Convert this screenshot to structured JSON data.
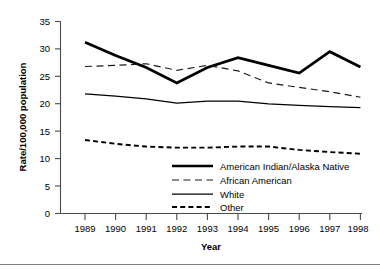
{
  "chart_data": {
    "type": "line",
    "title": "",
    "xlabel": "Year",
    "ylabel": "Rate/100,000 population",
    "x": [
      1989,
      1990,
      1991,
      1992,
      1993,
      1994,
      1995,
      1996,
      1997,
      1998
    ],
    "xticklabels": [
      "1989",
      "1990",
      "1991",
      "1992",
      "1993",
      "1994",
      "1995",
      "1996",
      "1997",
      "1998"
    ],
    "yticklabels": [
      "0",
      "5",
      "10",
      "15",
      "20",
      "25",
      "30",
      "35"
    ],
    "yticks": [
      0,
      5,
      10,
      15,
      20,
      25,
      30,
      35
    ],
    "ylim": [
      0,
      35
    ],
    "xlim": [
      1989,
      1998
    ],
    "grid": false,
    "legend_position": "lower center inside axes",
    "series": [
      {
        "name": "American Indian/Alaska Native",
        "style": "thick-solid",
        "values": [
          31.2,
          28.8,
          26.6,
          23.8,
          26.6,
          28.4,
          27.0,
          25.6,
          29.5,
          26.7
        ]
      },
      {
        "name": "African American",
        "style": "long-dash",
        "values": [
          26.8,
          27.0,
          27.3,
          26.1,
          27.0,
          26.0,
          23.8,
          23.0,
          22.2,
          21.2
        ]
      },
      {
        "name": "White",
        "style": "thin-solid",
        "values": [
          21.8,
          21.4,
          20.9,
          20.1,
          20.5,
          20.5,
          20.0,
          19.7,
          19.5,
          19.3
        ]
      },
      {
        "name": "Other",
        "style": "short-dash",
        "values": [
          13.4,
          12.7,
          12.2,
          12.0,
          12.0,
          12.2,
          12.2,
          11.6,
          11.2,
          10.9
        ]
      }
    ]
  },
  "legend": {
    "items": [
      {
        "label": "American Indian/Alaska Native"
      },
      {
        "label": "African American"
      },
      {
        "label": "White"
      },
      {
        "label": "Other"
      }
    ]
  },
  "axes": {
    "y_title": "Rate/100,000 population",
    "x_title": "Year"
  }
}
